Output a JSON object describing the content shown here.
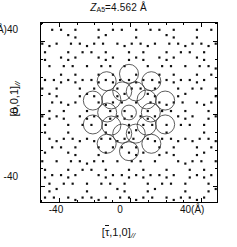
{
  "figure": {
    "title": {
      "symbol": "Z",
      "subscript": "A5",
      "equals": "=",
      "value": "4.562",
      "unit": "Å",
      "full": "Z_A5 = 4.562 Å"
    },
    "xaxis": {
      "label_open": "[",
      "label_tau": "τ",
      "label_rest": ",1,0]",
      "label_parallel": "//",
      "label_full": "[τ̄,1,0]//",
      "ticks": [
        "-40",
        "0",
        "40(Å)"
      ],
      "tick_values": [
        -40,
        0,
        40
      ],
      "minor_tick_step": 10,
      "range": [
        -50,
        50
      ],
      "unit": "Å"
    },
    "yaxis": {
      "label_text": "[0,0,1]",
      "label_parallel": "//",
      "label_full": "[0,0,1]//",
      "ticks": [
        "(Å)40",
        "0",
        "-40"
      ],
      "tick_values": [
        40,
        0,
        -40
      ],
      "minor_tick_step": 10,
      "range": [
        -50,
        50
      ],
      "unit": "Å"
    }
  },
  "chart_data": {
    "type": "scatter",
    "xlabel": "[τ̄,1,0]//",
    "ylabel": "[0,0,1]//",
    "xlim": [
      -50,
      50
    ],
    "ylim": [
      -50,
      50
    ],
    "grid": false,
    "legend": null,
    "marker": "square-dot",
    "marker_color": "#111111",
    "marker_size_px": 2.2,
    "point_count_approx": 900,
    "pattern": {
      "generator": "penrose-pentagrid",
      "symmetry_fold": 10,
      "quasilattice_constant": 4.562,
      "tau": 1.6180339887
    },
    "overlay_rings": {
      "stroke": "#333333",
      "stroke_width_px": 0.8,
      "fill": "none",
      "shells": [
        {
          "name": "center-ring",
          "count": 1,
          "radius_ang": 0,
          "ring_radius_ang": 4.2
        },
        {
          "name": "inner-decagon",
          "count": 10,
          "radius_ang": 12.4,
          "ring_radius_ang": 5.4
        },
        {
          "name": "outer-decagon",
          "count": 10,
          "radius_ang": 21.6,
          "ring_radius_ang": 5.4
        }
      ]
    }
  }
}
